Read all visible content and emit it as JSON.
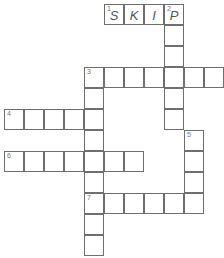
{
  "puzzle": {
    "type": "crossword",
    "cell_size": [
      20,
      21
    ],
    "cells": [
      {
        "x": 104,
        "y": 4,
        "num": "1",
        "letter": "S"
      },
      {
        "x": 124,
        "y": 4,
        "num": "",
        "letter": "K"
      },
      {
        "x": 144,
        "y": 4,
        "num": "",
        "letter": "I"
      },
      {
        "x": 164,
        "y": 4,
        "num": "2",
        "letter": "P"
      },
      {
        "x": 164,
        "y": 25,
        "num": "",
        "letter": ""
      },
      {
        "x": 164,
        "y": 46,
        "num": "",
        "letter": ""
      },
      {
        "x": 84,
        "y": 67,
        "num": "3",
        "letter": ""
      },
      {
        "x": 104,
        "y": 67,
        "num": "",
        "letter": ""
      },
      {
        "x": 124,
        "y": 67,
        "num": "",
        "letter": ""
      },
      {
        "x": 144,
        "y": 67,
        "num": "",
        "letter": ""
      },
      {
        "x": 164,
        "y": 67,
        "num": "",
        "letter": ""
      },
      {
        "x": 184,
        "y": 67,
        "num": "",
        "letter": ""
      },
      {
        "x": 204,
        "y": 67,
        "num": "",
        "letter": ""
      },
      {
        "x": 164,
        "y": 88,
        "num": "",
        "letter": ""
      },
      {
        "x": 164,
        "y": 109,
        "num": "",
        "letter": ""
      },
      {
        "x": 84,
        "y": 88,
        "num": "",
        "letter": ""
      },
      {
        "x": 4,
        "y": 109,
        "num": "4",
        "letter": ""
      },
      {
        "x": 24,
        "y": 109,
        "num": "",
        "letter": ""
      },
      {
        "x": 44,
        "y": 109,
        "num": "",
        "letter": ""
      },
      {
        "x": 64,
        "y": 109,
        "num": "",
        "letter": ""
      },
      {
        "x": 84,
        "y": 109,
        "num": "",
        "letter": ""
      },
      {
        "x": 84,
        "y": 130,
        "num": "",
        "letter": ""
      },
      {
        "x": 184,
        "y": 130,
        "num": "5",
        "letter": ""
      },
      {
        "x": 4,
        "y": 151,
        "num": "6",
        "letter": ""
      },
      {
        "x": 24,
        "y": 151,
        "num": "",
        "letter": ""
      },
      {
        "x": 44,
        "y": 151,
        "num": "",
        "letter": ""
      },
      {
        "x": 64,
        "y": 151,
        "num": "",
        "letter": ""
      },
      {
        "x": 84,
        "y": 151,
        "num": "",
        "letter": ""
      },
      {
        "x": 104,
        "y": 151,
        "num": "",
        "letter": ""
      },
      {
        "x": 124,
        "y": 151,
        "num": "",
        "letter": ""
      },
      {
        "x": 184,
        "y": 151,
        "num": "",
        "letter": ""
      },
      {
        "x": 84,
        "y": 172,
        "num": "",
        "letter": ""
      },
      {
        "x": 184,
        "y": 172,
        "num": "",
        "letter": ""
      },
      {
        "x": 84,
        "y": 193,
        "num": "7",
        "letter": ""
      },
      {
        "x": 104,
        "y": 193,
        "num": "",
        "letter": ""
      },
      {
        "x": 124,
        "y": 193,
        "num": "",
        "letter": ""
      },
      {
        "x": 144,
        "y": 193,
        "num": "",
        "letter": ""
      },
      {
        "x": 164,
        "y": 193,
        "num": "",
        "letter": ""
      },
      {
        "x": 184,
        "y": 193,
        "num": "",
        "letter": ""
      },
      {
        "x": 84,
        "y": 214,
        "num": "",
        "letter": ""
      },
      {
        "x": 84,
        "y": 235,
        "num": "",
        "letter": ""
      }
    ]
  }
}
